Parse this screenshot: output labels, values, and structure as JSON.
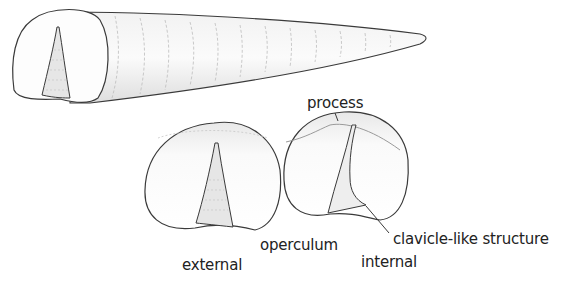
{
  "figure": {
    "type": "anatomical illustration",
    "subjects": [
      "conical shell",
      "operculum external view",
      "operculum internal view"
    ],
    "labels": {
      "process": "process",
      "operculum": "operculum",
      "external": "external",
      "internal": "internal",
      "clavicle": "clavicle-like structure"
    },
    "colors": {
      "line": "#3a3a3a",
      "shade": "#d9d9d9",
      "background": "#ffffff"
    }
  }
}
